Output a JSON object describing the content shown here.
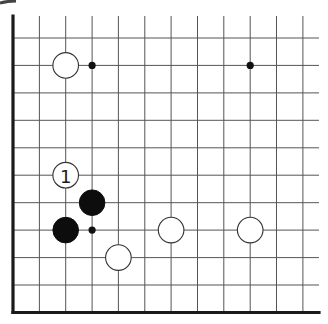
{
  "diagram": {
    "type": "go-board-fragment",
    "grid": {
      "x_lines": [
        13,
        39.4,
        65.7,
        92.1,
        118.4,
        144.8,
        171.1,
        197.5,
        223.8,
        250.2,
        276.5,
        302.9
      ],
      "y_lines": [
        38,
        65.4,
        92.9,
        120.3,
        147.8,
        175.2,
        202.7,
        230.1,
        257.6,
        285,
        312.5
      ],
      "x_end": 319,
      "y_start": 16,
      "line_color": "#555555",
      "edge_color": "#1a1a1a",
      "left_edge": true,
      "bottom_edge": true
    },
    "star_points": [
      {
        "col": 3,
        "row": 1
      },
      {
        "col": 9,
        "row": 1
      },
      {
        "col": 3,
        "row": 7
      }
    ],
    "stones": [
      {
        "color": "white",
        "col": 2,
        "row": 1,
        "label": ""
      },
      {
        "color": "white",
        "col": 2,
        "row": 5,
        "label": "1"
      },
      {
        "color": "black",
        "col": 3,
        "row": 6,
        "label": ""
      },
      {
        "color": "black",
        "col": 2,
        "row": 7,
        "label": ""
      },
      {
        "color": "white",
        "col": 6,
        "row": 7,
        "label": ""
      },
      {
        "color": "white",
        "col": 9,
        "row": 7,
        "label": ""
      },
      {
        "color": "white",
        "col": 4,
        "row": 8,
        "label": ""
      }
    ],
    "stone_radius": 12.8,
    "star_radius": 3.6,
    "move_label": "1"
  }
}
